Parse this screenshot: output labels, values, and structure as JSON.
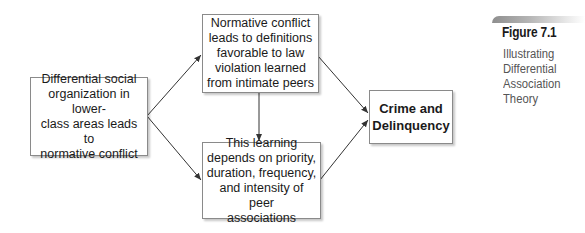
{
  "figure": {
    "label": "Figure 7.1",
    "caption": "Illustrating\nDifferential\nAssociation\nTheory"
  },
  "nodes": {
    "origin": {
      "text": "Differential social\norganization in lower-\nclass areas leads to\nnormative conflict"
    },
    "normative": {
      "text": "Normative conflict\nleads to definitions\nfavorable to law\nviolation learned\nfrom intimate peers"
    },
    "learning": {
      "text": "This learning\ndepends on priority,\nduration, frequency,\nand intensity of peer\nassociations"
    },
    "outcome": {
      "text": "Crime and\nDelinquency"
    }
  },
  "edges": [
    {
      "from": "origin",
      "to": "normative"
    },
    {
      "from": "origin",
      "to": "learning"
    },
    {
      "from": "normative",
      "to": "learning"
    },
    {
      "from": "normative",
      "to": "outcome"
    },
    {
      "from": "learning",
      "to": "outcome"
    }
  ],
  "colors": {
    "line": "#333333",
    "border": "#8a8a8a",
    "caption": "#555555"
  }
}
